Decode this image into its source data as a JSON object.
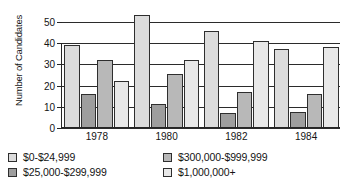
{
  "chart_data": {
    "type": "bar",
    "title": "",
    "subtitle": "",
    "xlabel": "",
    "ylabel": "Number of Candidates",
    "categories": [
      "1978",
      "1980",
      "1982",
      "1984"
    ],
    "ylim": [
      0,
      50
    ],
    "yticks": [
      0,
      10,
      20,
      30,
      40,
      50
    ],
    "ytick_labels": [
      "0",
      "10",
      "20",
      "30",
      "40",
      "50"
    ],
    "grid": true,
    "grid_axis": "y",
    "legend_position": "bottom",
    "bar_style": "grouped",
    "series": [
      {
        "name": "$0-$24,999",
        "color": "#dcdcdc",
        "values": [
          39,
          53,
          45.5,
          37
        ]
      },
      {
        "name": "$25,000-$299,999",
        "color": "#9e9e9e",
        "values": [
          16,
          11.5,
          7,
          7.5
        ]
      },
      {
        "name": "$300,000-$999,999",
        "color": "#9e9e9e",
        "values": [
          32,
          25.5,
          17,
          16
        ]
      },
      {
        "name": "$1,000,000+",
        "color": "#dcdcdc",
        "values": [
          22,
          32,
          41,
          38
        ]
      }
    ]
  },
  "axis": {
    "y_title": "Number of Candidates",
    "y_ticks": [
      "0",
      "10",
      "20",
      "30",
      "40",
      "50"
    ],
    "x_ticks": [
      "1978",
      "1980",
      "1982",
      "1984"
    ]
  },
  "legend": {
    "items": [
      {
        "label": "$0-$24,999",
        "swatch": "light"
      },
      {
        "label": "$300,000-$999,999",
        "swatch": "mid"
      },
      {
        "label": "$25,000-$299,999",
        "swatch": "dark"
      },
      {
        "label": "$1,000,000+",
        "swatch": "pale"
      }
    ]
  },
  "colors": {
    "light": "#dcdcdc",
    "mid": "#b8b8b8",
    "dark": "#9e9e9e",
    "pale": "#e8e8e8",
    "stroke": "#2e2e2e",
    "axis": "#262626"
  }
}
